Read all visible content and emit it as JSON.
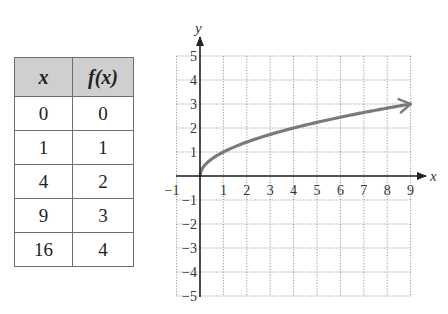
{
  "table": {
    "headers": [
      "x",
      "f(x)"
    ],
    "rows": [
      [
        "0",
        "0"
      ],
      [
        "1",
        "1"
      ],
      [
        "4",
        "2"
      ],
      [
        "9",
        "3"
      ],
      [
        "16",
        "4"
      ]
    ],
    "header_bg": "#cfcfcf"
  },
  "graph": {
    "x_axis_label": "x",
    "y_axis_label": "y",
    "x_ticks": [
      "-1",
      "1",
      "2",
      "3",
      "4",
      "5",
      "6",
      "7",
      "8",
      "9"
    ],
    "y_ticks": [
      "5",
      "4",
      "3",
      "2",
      "1",
      "-1",
      "-2",
      "-3",
      "-4",
      "-5"
    ],
    "curve_color": "#7a7a7a"
  },
  "chart_data": {
    "type": "line",
    "title": "",
    "xlabel": "x",
    "ylabel": "y",
    "xlim": [
      -1,
      9
    ],
    "ylim": [
      -5,
      5
    ],
    "grid": true,
    "legend": null,
    "series": [
      {
        "name": "f(x) = sqrt(x)",
        "x": [
          0,
          0.25,
          1,
          2,
          3,
          4,
          5,
          6,
          7,
          8,
          9
        ],
        "y": [
          0,
          0.5,
          1,
          1.41,
          1.73,
          2,
          2.24,
          2.45,
          2.65,
          2.83,
          3
        ],
        "end_arrow": true
      }
    ],
    "table": {
      "columns": [
        "x",
        "f(x)"
      ],
      "rows": [
        [
          0,
          0
        ],
        [
          1,
          1
        ],
        [
          4,
          2
        ],
        [
          9,
          3
        ],
        [
          16,
          4
        ]
      ]
    }
  }
}
